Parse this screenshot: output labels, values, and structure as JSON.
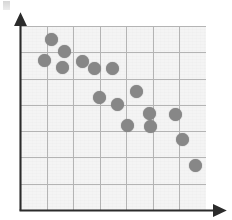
{
  "chart_data": {
    "type": "scatter",
    "title": "",
    "subtitle": "",
    "xlabel": "",
    "ylabel": "",
    "xlim": [
      0,
      7
    ],
    "ylim": [
      0,
      7
    ],
    "grid": true,
    "legend": null,
    "x_tick_labels": [],
    "y_tick_labels": [],
    "n_x_gridlines": 7,
    "n_y_gridlines": 7,
    "relationship": "negative",
    "point_count": 16,
    "series": [
      {
        "name": "data",
        "marker": "circle",
        "color": "#878787",
        "points": [
          {
            "x": 1.18,
            "y": 6.48
          },
          {
            "x": 1.68,
            "y": 6.02
          },
          {
            "x": 0.92,
            "y": 5.7
          },
          {
            "x": 1.6,
            "y": 5.44
          },
          {
            "x": 2.36,
            "y": 5.66
          },
          {
            "x": 2.82,
            "y": 5.38
          },
          {
            "x": 3.48,
            "y": 5.4
          },
          {
            "x": 3.0,
            "y": 4.28
          },
          {
            "x": 3.66,
            "y": 4.02
          },
          {
            "x": 4.38,
            "y": 4.52
          },
          {
            "x": 4.86,
            "y": 3.68
          },
          {
            "x": 5.86,
            "y": 3.62
          },
          {
            "x": 4.04,
            "y": 3.22
          },
          {
            "x": 4.92,
            "y": 3.16
          },
          {
            "x": 6.12,
            "y": 2.68
          },
          {
            "x": 6.6,
            "y": 1.7
          }
        ]
      }
    ]
  },
  "axes": {
    "x_axis_name": "x-axis",
    "y_axis_name": "y-axis",
    "arrow_style": "solid-arrowhead",
    "axis_color": "#2b2b2b"
  },
  "colors": {
    "point": "#878787",
    "grid": "#b4b4b4",
    "plot_background": "#f4f4f4",
    "axis": "#2b2b2b",
    "page_background": "#ffffff"
  },
  "geometry": {
    "plot_left": 20,
    "plot_top": 26,
    "plot_width": 186,
    "plot_height": 184,
    "cell_w": 26.57,
    "cell_h": 26.29
  },
  "marks": {
    "corner_smudge_label": "scan-artifact"
  }
}
